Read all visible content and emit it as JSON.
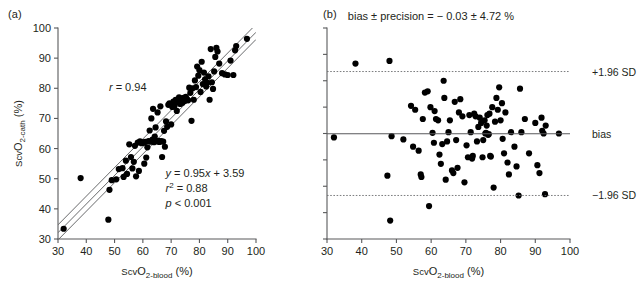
{
  "figure": {
    "panel_a_label": "(a)",
    "panel_b_label": "(b)"
  },
  "chart_data": [
    {
      "type": "scatter",
      "panel": "(a)",
      "title": "",
      "xlabel": "ScvO2-blood (%)",
      "ylabel": "ScvO2-cath (%)",
      "xlim": [
        30,
        100
      ],
      "ylim": [
        30,
        100
      ],
      "xticks": [
        30,
        40,
        50,
        60,
        70,
        80,
        90,
        100
      ],
      "yticks": [
        30,
        40,
        50,
        60,
        70,
        80,
        90,
        100
      ],
      "grid": false,
      "legend": "none",
      "annotations": [
        {
          "name": "correlation",
          "text_plain": "r = 0.94",
          "x": 52,
          "y": 79
        },
        {
          "name": "regression-equation",
          "text_plain": "y = 0.95x + 3.59",
          "x": 72,
          "y": 49
        },
        {
          "name": "r-squared",
          "text_plain": "r2 = 0.88",
          "x": 72,
          "y": 45
        },
        {
          "name": "p-value",
          "text_plain": "p < 0.001",
          "x": 72,
          "y": 41
        }
      ],
      "annotation_parts": {
        "r_symbol": "r",
        "r_value": " = 0.94",
        "eq_y": "y",
        "eq_mid": " = 0.95",
        "eq_x": "x",
        "eq_tail": " + 3.59",
        "r2_symbol": "r",
        "r2_sup": "2",
        "r2_value": " = 0.88",
        "p_symbol": "p",
        "p_value": " < 0.001"
      },
      "fit_lines": [
        {
          "name": "regression-line",
          "slope": 0.95,
          "intercept": 3.59
        },
        {
          "name": "upper-band-line",
          "slope": 0.95,
          "intercept": 6.2
        },
        {
          "name": "lower-band-line",
          "slope": 0.95,
          "intercept": 1.2
        }
      ],
      "points": [
        [
          32.0,
          33.4
        ],
        [
          38.0,
          50.2
        ],
        [
          47.8,
          36.4
        ],
        [
          48.2,
          46.3
        ],
        [
          49.0,
          49.5
        ],
        [
          50.6,
          49.8
        ],
        [
          51.5,
          53.2
        ],
        [
          52.8,
          53.5
        ],
        [
          53.2,
          50.6
        ],
        [
          54.0,
          56.0
        ],
        [
          54.4,
          51.6
        ],
        [
          55.2,
          61.4
        ],
        [
          55.8,
          57.2
        ],
        [
          56.3,
          53.4
        ],
        [
          56.8,
          55.6
        ],
        [
          57.2,
          60.9
        ],
        [
          57.6,
          50.8
        ],
        [
          58.2,
          62.0
        ],
        [
          58.6,
          52.6
        ],
        [
          59.0,
          62.4
        ],
        [
          59.5,
          61.8
        ],
        [
          59.8,
          62.1
        ],
        [
          60.2,
          61.9
        ],
        [
          60.5,
          55.0
        ],
        [
          60.8,
          62.2
        ],
        [
          61.2,
          57.0
        ],
        [
          61.6,
          60.4
        ],
        [
          62.0,
          62.5
        ],
        [
          62.4,
          66.0
        ],
        [
          62.8,
          62.3
        ],
        [
          63.0,
          70.0
        ],
        [
          63.4,
          63.0
        ],
        [
          63.6,
          73.2
        ],
        [
          63.9,
          62.1
        ],
        [
          64.2,
          64.0
        ],
        [
          64.5,
          67.0
        ],
        [
          64.8,
          62.4
        ],
        [
          65.2,
          72.0
        ],
        [
          65.5,
          62.6
        ],
        [
          65.8,
          62.2
        ],
        [
          66.2,
          74.0
        ],
        [
          66.5,
          62.5
        ],
        [
          66.8,
          57.2
        ],
        [
          67.2,
          62.3
        ],
        [
          67.5,
          65.9
        ],
        [
          67.8,
          60.6
        ],
        [
          68.2,
          69.0
        ],
        [
          68.6,
          67.2
        ],
        [
          69.0,
          74.5
        ],
        [
          69.4,
          75.0
        ],
        [
          70.0,
          68.0
        ],
        [
          70.4,
          73.8
        ],
        [
          70.8,
          75.6
        ],
        [
          71.2,
          74.2
        ],
        [
          71.6,
          76.2
        ],
        [
          72.0,
          72.5
        ],
        [
          72.4,
          75.4
        ],
        [
          72.8,
          77.0
        ],
        [
          73.2,
          74.8
        ],
        [
          73.6,
          76.6
        ],
        [
          74.0,
          75.2
        ],
        [
          74.4,
          76.8
        ],
        [
          74.8,
          75.8
        ],
        [
          75.2,
          77.2
        ],
        [
          75.6,
          76.4
        ],
        [
          76.0,
          76.0
        ],
        [
          76.4,
          80.2
        ],
        [
          76.8,
          78.5
        ],
        [
          77.2,
          69.2
        ],
        [
          77.6,
          80.0
        ],
        [
          78.0,
          76.2
        ],
        [
          78.4,
          82.6
        ],
        [
          78.8,
          80.4
        ],
        [
          79.2,
          87.2
        ],
        [
          79.6,
          84.2
        ],
        [
          80.0,
          86.0
        ],
        [
          80.4,
          78.8
        ],
        [
          80.8,
          88.8
        ],
        [
          81.2,
          81.4
        ],
        [
          81.6,
          85.2
        ],
        [
          82.0,
          83.0
        ],
        [
          82.4,
          80.6
        ],
        [
          82.8,
          81.8
        ],
        [
          83.2,
          84.0
        ],
        [
          83.6,
          76.2
        ],
        [
          84.0,
          93.0
        ],
        [
          84.4,
          82.0
        ],
        [
          84.8,
          79.8
        ],
        [
          85.2,
          85.6
        ],
        [
          85.6,
          90.4
        ],
        [
          86.0,
          93.4
        ],
        [
          86.4,
          92.2
        ],
        [
          87.0,
          88.2
        ],
        [
          88.0,
          85.0
        ],
        [
          89.0,
          84.6
        ],
        [
          90.0,
          84.4
        ],
        [
          91.0,
          89.2
        ],
        [
          92.0,
          84.4
        ],
        [
          92.6,
          92.6
        ],
        [
          93.0,
          94.0
        ],
        [
          96.8,
          96.4
        ]
      ]
    },
    {
      "type": "scatter",
      "panel": "(b)",
      "title": "bias ± precision = − 0.03 ± 4.72 %",
      "xlabel": "ScvO2-blood (%)",
      "ylabel": "ScvO2-cath − ScvO2-blood (%)",
      "xlim": [
        30,
        100
      ],
      "ylim": [
        -16,
        16
      ],
      "xticks": [
        30,
        40,
        50,
        60,
        70,
        80,
        90,
        100
      ],
      "yticks": [
        16,
        12,
        8,
        4,
        0,
        -4,
        -8,
        -12,
        -16
      ],
      "grid": false,
      "legend": "none",
      "reference_lines": [
        {
          "name": "upper-limit-of-agreement",
          "label": "+1.96 SD",
          "value": 9.4,
          "style": "dotted"
        },
        {
          "name": "bias-line",
          "label": "bias",
          "value": -0.03,
          "style": "solid"
        },
        {
          "name": "lower-limit-of-agreement",
          "label": "−1.96 SD",
          "value": -9.4,
          "style": "dotted"
        }
      ],
      "bias": -0.03,
      "precision": 4.72,
      "points": [
        [
          32.0,
          -0.6
        ],
        [
          38.2,
          10.6
        ],
        [
          47.4,
          -6.4
        ],
        [
          48.0,
          11.0
        ],
        [
          48.2,
          -13.2
        ],
        [
          48.6,
          -0.4
        ],
        [
          52.0,
          -0.9
        ],
        [
          54.2,
          4.2
        ],
        [
          54.8,
          -2.0
        ],
        [
          55.4,
          3.6
        ],
        [
          56.4,
          -2.6
        ],
        [
          57.0,
          -6.2
        ],
        [
          57.2,
          -6.6
        ],
        [
          57.6,
          2.2
        ],
        [
          58.2,
          6.2
        ],
        [
          59.0,
          6.4
        ],
        [
          59.4,
          -11.0
        ],
        [
          59.8,
          4.0
        ],
        [
          60.4,
          0.1
        ],
        [
          60.8,
          -1.4
        ],
        [
          61.0,
          3.4
        ],
        [
          61.4,
          2.2
        ],
        [
          62.0,
          2.0
        ],
        [
          62.4,
          -3.2
        ],
        [
          62.8,
          -4.6
        ],
        [
          63.2,
          -1.6
        ],
        [
          63.6,
          8.0
        ],
        [
          63.8,
          5.4
        ],
        [
          64.2,
          -7.0
        ],
        [
          64.6,
          -1.2
        ],
        [
          65.0,
          0.2
        ],
        [
          65.4,
          2.0
        ],
        [
          66.0,
          -5.6
        ],
        [
          66.4,
          -6.0
        ],
        [
          66.8,
          4.8
        ],
        [
          67.2,
          -1.0
        ],
        [
          67.6,
          -5.2
        ],
        [
          68.0,
          3.2
        ],
        [
          68.4,
          5.2
        ],
        [
          69.0,
          2.6
        ],
        [
          69.6,
          -7.4
        ],
        [
          70.2,
          -1.8
        ],
        [
          70.6,
          -3.6
        ],
        [
          71.0,
          2.8
        ],
        [
          71.4,
          0.2
        ],
        [
          71.8,
          -3.8
        ],
        [
          72.0,
          -3.4
        ],
        [
          72.4,
          3.0
        ],
        [
          72.8,
          2.6
        ],
        [
          73.2,
          -1.2
        ],
        [
          73.6,
          1.0
        ],
        [
          74.0,
          2.4
        ],
        [
          74.4,
          1.6
        ],
        [
          74.8,
          -3.6
        ],
        [
          75.0,
          -1.0
        ],
        [
          75.4,
          2.0
        ],
        [
          75.6,
          0.0
        ],
        [
          75.8,
          0.1
        ],
        [
          76.0,
          1.2
        ],
        [
          76.2,
          2.8
        ],
        [
          76.4,
          -0.2
        ],
        [
          76.6,
          -0.1
        ],
        [
          76.8,
          3.0
        ],
        [
          77.0,
          -3.4
        ],
        [
          77.2,
          -3.5
        ],
        [
          77.6,
          4.0
        ],
        [
          78.0,
          -8.2
        ],
        [
          78.4,
          1.8
        ],
        [
          78.8,
          5.4
        ],
        [
          79.2,
          3.6
        ],
        [
          79.6,
          7.0
        ],
        [
          80.0,
          2.0
        ],
        [
          80.4,
          4.6
        ],
        [
          80.6,
          -0.8
        ],
        [
          81.0,
          -3.0
        ],
        [
          81.4,
          3.2
        ],
        [
          82.0,
          -4.4
        ],
        [
          82.4,
          -6.2
        ],
        [
          83.0,
          0.2
        ],
        [
          84.0,
          -2.0
        ],
        [
          84.6,
          -5.0
        ],
        [
          85.2,
          -9.4
        ],
        [
          85.6,
          6.8
        ],
        [
          86.0,
          0.2
        ],
        [
          87.0,
          2.2
        ],
        [
          88.2,
          -3.0
        ],
        [
          90.0,
          1.6
        ],
        [
          90.6,
          -4.8
        ],
        [
          91.2,
          -6.0
        ],
        [
          91.8,
          2.4
        ],
        [
          92.0,
          0.4
        ],
        [
          92.4,
          0.0
        ],
        [
          92.8,
          -9.2
        ],
        [
          93.0,
          1.2
        ],
        [
          96.8,
          0.0
        ]
      ]
    }
  ]
}
